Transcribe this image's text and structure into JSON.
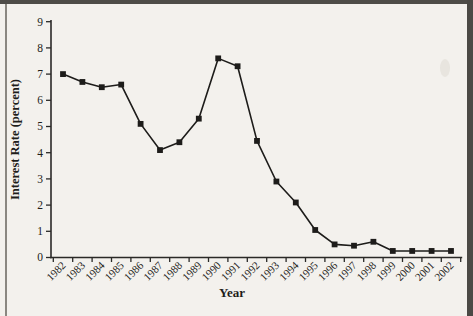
{
  "page": {
    "background_color": "#f3f1ed",
    "border_top_color": "#4e4c48",
    "border_left_color": "#8a8781",
    "border_right_color": "#4b4945",
    "ink_color": "#1e1d1a"
  },
  "chart_data": {
    "type": "line",
    "title": "",
    "xlabel": "Year",
    "ylabel": "Interest Rate (percent)",
    "x": [
      "1982",
      "1983",
      "1984",
      "1985",
      "1986",
      "1987",
      "1988",
      "1989",
      "1990",
      "1991",
      "1992",
      "1993",
      "1994",
      "1995",
      "1996",
      "1997",
      "1998",
      "1999",
      "2000",
      "2001",
      "2002"
    ],
    "series": [
      {
        "name": "Interest Rate",
        "values": [
          7.0,
          6.7,
          6.5,
          6.6,
          5.1,
          4.1,
          4.4,
          5.3,
          7.6,
          7.3,
          4.45,
          2.9,
          2.1,
          1.05,
          0.5,
          0.45,
          0.6,
          0.25,
          0.25,
          0.25,
          0.25
        ]
      }
    ],
    "ylim": [
      0,
      9
    ],
    "ytick_step": 1,
    "yticks": [
      0,
      1,
      2,
      3,
      4,
      5,
      6,
      7,
      8,
      9
    ],
    "grid": false,
    "legend_position": "none",
    "marker": "square",
    "line_color": "#1d1c1a",
    "marker_color": "#1d1c1a",
    "axis_color": "#2a2927"
  }
}
